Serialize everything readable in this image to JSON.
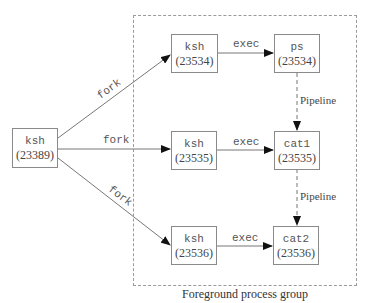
{
  "diagram": {
    "group_label": "Foreground process group",
    "parent": {
      "name": "ksh",
      "pid": "(23389)"
    },
    "rows": [
      {
        "fork_label": "fork",
        "child": {
          "name": "ksh",
          "pid": "(23534)"
        },
        "exec_label": "exec",
        "exec_result": {
          "name": "ps",
          "pid": "(23534)"
        }
      },
      {
        "fork_label": "fork",
        "child": {
          "name": "ksh",
          "pid": "(23535)"
        },
        "exec_label": "exec",
        "exec_result": {
          "name": "cat1",
          "pid": "(23535)"
        }
      },
      {
        "fork_label": "fork",
        "child": {
          "name": "ksh",
          "pid": "(23536)"
        },
        "exec_label": "exec",
        "exec_result": {
          "name": "cat2",
          "pid": "(23536)"
        }
      }
    ],
    "pipelines": [
      {
        "label": "Pipeline",
        "from": "ps",
        "to": "cat1"
      },
      {
        "label": "Pipeline",
        "from": "cat1",
        "to": "cat2"
      }
    ]
  }
}
